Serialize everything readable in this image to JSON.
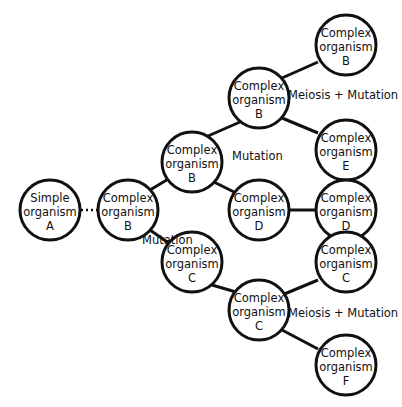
{
  "diagram": {
    "type": "evolutionary-tree",
    "nodes": [
      {
        "id": "A",
        "line1": "Simple",
        "line2": "organism",
        "line3": "A",
        "cx": 50,
        "cy": 210
      },
      {
        "id": "B1",
        "line1": "Complex",
        "line2": "organism",
        "line3": "B",
        "cx": 128,
        "cy": 210
      },
      {
        "id": "B2",
        "line1": "Complex",
        "line2": "organism",
        "line3": "B",
        "cx": 192,
        "cy": 162
      },
      {
        "id": "C1",
        "line1": "Complex",
        "line2": "organism",
        "line3": "C",
        "cx": 192,
        "cy": 262
      },
      {
        "id": "B3",
        "line1": "Complex",
        "line2": "organism",
        "line3": "B",
        "cx": 259,
        "cy": 98
      },
      {
        "id": "D1",
        "line1": "Complex",
        "line2": "organism",
        "line3": "D",
        "cx": 259,
        "cy": 210
      },
      {
        "id": "B4",
        "line1": "Complex",
        "line2": "organism",
        "line3": "B",
        "cx": 346,
        "cy": 45
      },
      {
        "id": "E",
        "line1": "Complex",
        "line2": "organism",
        "line3": "E",
        "cx": 346,
        "cy": 150
      },
      {
        "id": "D2",
        "line1": "Complex",
        "line2": "organism",
        "line3": "D",
        "cx": 346,
        "cy": 210
      },
      {
        "id": "C2",
        "line1": "Complex",
        "line2": "organism",
        "line3": "C",
        "cx": 259,
        "cy": 310
      },
      {
        "id": "C3",
        "line1": "Complex",
        "line2": "organism",
        "line3": "C",
        "cx": 346,
        "cy": 262
      },
      {
        "id": "F",
        "line1": "Complex",
        "line2": "organism",
        "line3": "F",
        "cx": 346,
        "cy": 365
      }
    ],
    "edges": [
      {
        "from": "A",
        "to": "B1",
        "style": "dotted"
      },
      {
        "from": "B1",
        "to": "B2",
        "style": "solid"
      },
      {
        "from": "B1",
        "to": "C1",
        "style": "solid"
      },
      {
        "from": "B2",
        "to": "B3",
        "style": "solid"
      },
      {
        "from": "B2",
        "to": "D1",
        "style": "solid"
      },
      {
        "from": "B3",
        "to": "B4",
        "style": "solid"
      },
      {
        "from": "B3",
        "to": "E",
        "style": "solid"
      },
      {
        "from": "D1",
        "to": "D2",
        "style": "solid"
      },
      {
        "from": "C1",
        "to": "C2",
        "style": "solid"
      },
      {
        "from": "C2",
        "to": "C3",
        "style": "solid"
      },
      {
        "from": "C2",
        "to": "F",
        "style": "solid"
      }
    ],
    "labels": {
      "mutation_1": "Mutation",
      "mutation_2": "Mutation",
      "meiosis_mutation_1": "Meiosis + Mutation",
      "meiosis_mutation_2": "Meiosis + Mutation"
    }
  }
}
